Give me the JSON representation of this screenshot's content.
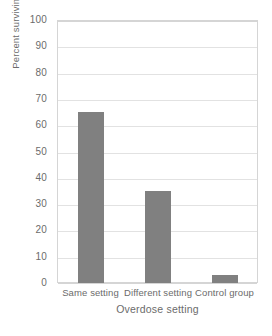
{
  "chart_data": {
    "type": "bar",
    "title": "",
    "subtitle": "",
    "categories": [
      "Same setting",
      "Different setting",
      "Control group"
    ],
    "values": [
      65,
      35,
      3
    ],
    "xlabel": "Overdose setting",
    "ylabel": "Percent surviving",
    "ylim": [
      0,
      100
    ],
    "ytick_labels": [
      "100",
      "90",
      "80",
      "70",
      "60",
      "50",
      "40",
      "30",
      "20",
      "10",
      "0"
    ],
    "ytick_values": [
      100,
      90,
      80,
      70,
      60,
      50,
      40,
      30,
      20,
      10,
      0
    ],
    "ytick_step": 10,
    "grid": true,
    "grid_axis": "y",
    "legend": false,
    "legend_position": "none",
    "bar_color": "#808080",
    "grid_color": "#e2e2e2",
    "frame_color": "#d5d5d5",
    "text_color": "#6b6b6b",
    "background": "#ffffff",
    "annotations": []
  }
}
